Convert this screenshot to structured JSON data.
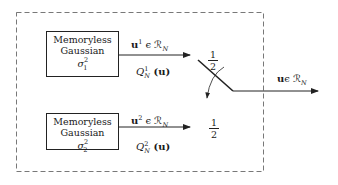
{
  "diagram": {
    "type": "block-diagram",
    "container": {
      "style": "dashed-rectangle"
    },
    "sources": [
      {
        "id": "source-1",
        "line1": "Memoryless",
        "line2": "Gaussian",
        "variance": "σ",
        "variance_sup": "2",
        "variance_sub": "1",
        "output_vector": "u",
        "output_sup": "1",
        "output_space": " ϵ ℛ",
        "output_space_sub": "N",
        "distribution": "Q",
        "distribution_sup": "1",
        "distribution_sub": "N",
        "distribution_arg": " (u)",
        "probability_num": "1",
        "probability_den": "2"
      },
      {
        "id": "source-2",
        "line1": "Memoryless",
        "line2": "Gaussian",
        "variance": "σ",
        "variance_sup": "2",
        "variance_sub": "2",
        "output_vector": "u",
        "output_sup": "2",
        "output_space": " ϵ ℛ",
        "output_space_sub": "N",
        "distribution": "Q",
        "distribution_sup": "2",
        "distribution_sub": "N",
        "distribution_arg": " (u)",
        "probability_num": "1",
        "probability_den": "2"
      }
    ],
    "switch": {
      "type": "random-switch"
    },
    "output": {
      "vector": "u",
      "space": "ϵ ℛ",
      "space_sub": "N"
    }
  }
}
